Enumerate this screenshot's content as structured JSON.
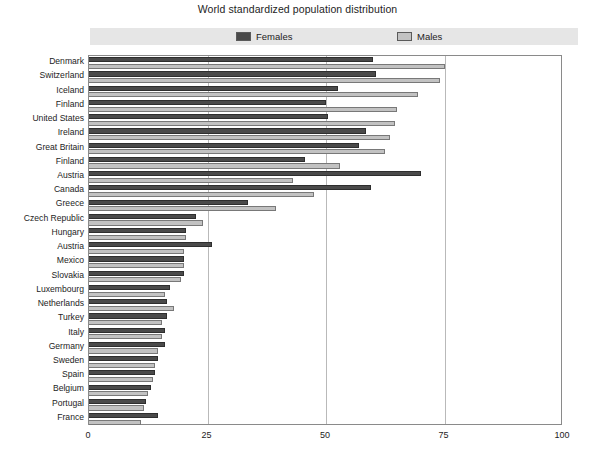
{
  "chart_data": {
    "type": "bar",
    "orientation": "horizontal",
    "title": "World standardized population distribution",
    "xlabel": "",
    "ylabel": "",
    "xlim": [
      0,
      100
    ],
    "xticks": [
      0,
      25,
      50,
      75,
      100
    ],
    "grid": true,
    "legend_position": "top",
    "categories": [
      "Denmark",
      "Switzerland",
      "Iceland",
      "Finland",
      "United States",
      "Ireland",
      "Great Britain",
      "Finland",
      "Austria",
      "Canada",
      "Greece",
      "Czech Republic",
      "Hungary",
      "Austria",
      "Mexico",
      "Slovakia",
      "Luxembourg",
      "Netherlands",
      "Turkey",
      "Italy",
      "Germany",
      "Sweden",
      "Spain",
      "Belgium",
      "Portugal",
      "France"
    ],
    "series": [
      {
        "name": "Females",
        "color": "#4a4a4a",
        "values": [
          60.0,
          60.5,
          52.5,
          50.0,
          50.5,
          58.5,
          57.0,
          45.5,
          70.0,
          59.5,
          33.5,
          22.5,
          20.5,
          26.0,
          20.0,
          20.0,
          17.0,
          16.5,
          16.5,
          16.0,
          16.0,
          14.5,
          14.0,
          13.0,
          12.0,
          14.5
        ]
      },
      {
        "name": "Males",
        "color": "#c2c2c2",
        "values": [
          75.0,
          74.0,
          69.5,
          65.0,
          64.5,
          63.5,
          62.5,
          53.0,
          43.0,
          47.5,
          39.5,
          24.0,
          20.5,
          20.0,
          20.0,
          19.5,
          16.0,
          18.0,
          15.5,
          15.5,
          14.5,
          14.0,
          13.5,
          12.5,
          11.5,
          11.0
        ]
      }
    ]
  },
  "legend": {
    "females_label": "Females",
    "males_label": "Males"
  },
  "colors": {
    "female": "#4a4a4a",
    "female_edge": "#2e2e2e",
    "male": "#c2c2c2",
    "male_edge": "#787878",
    "legend_band": "#e6e6e6",
    "grid": "#b9b9b9",
    "frame": "#8a8a8a"
  }
}
